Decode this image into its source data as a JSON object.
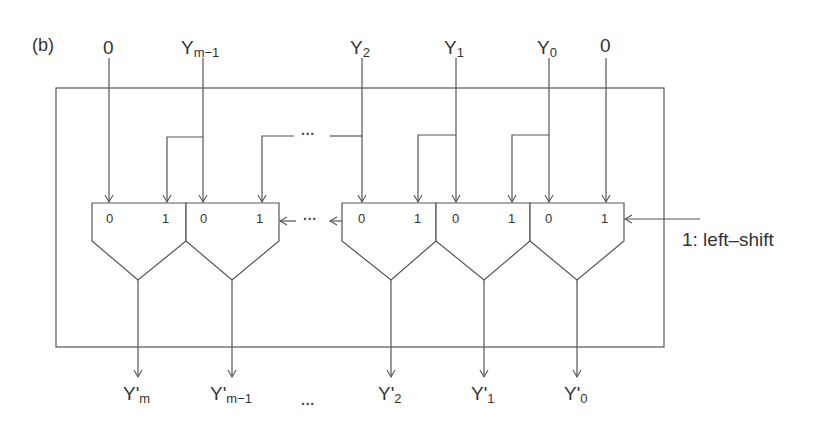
{
  "figure_label": "(b)",
  "inputs": [
    {
      "id": "in-zero-left",
      "main": "0",
      "sub": ""
    },
    {
      "id": "in-ym1",
      "main": "Y",
      "sub": "m−1"
    },
    {
      "id": "in-y2",
      "main": "Y",
      "sub": "2"
    },
    {
      "id": "in-y1",
      "main": "Y",
      "sub": "1"
    },
    {
      "id": "in-y0",
      "main": "Y",
      "sub": "0"
    },
    {
      "id": "in-zero-right",
      "main": "0",
      "sub": ""
    }
  ],
  "outputs": [
    {
      "id": "out-ym",
      "main": "Y'",
      "sub": "m"
    },
    {
      "id": "out-ym1",
      "main": "Y'",
      "sub": "m−1"
    },
    {
      "id": "out-y2",
      "main": "Y'",
      "sub": "2"
    },
    {
      "id": "out-y1",
      "main": "Y'",
      "sub": "1"
    },
    {
      "id": "out-y0",
      "main": "Y'",
      "sub": "0"
    }
  ],
  "muxes": [
    {
      "pin0": "0",
      "pin1": "1"
    },
    {
      "pin0": "0",
      "pin1": "1"
    },
    {
      "pin0": "0",
      "pin1": "1"
    },
    {
      "pin0": "0",
      "pin1": "1"
    },
    {
      "pin0": "0",
      "pin1": "1"
    }
  ],
  "control_label": "1: left–shift",
  "ellipsis": "···",
  "colors": {
    "line": "#555555",
    "text": "#333333",
    "background": "#ffffff"
  }
}
